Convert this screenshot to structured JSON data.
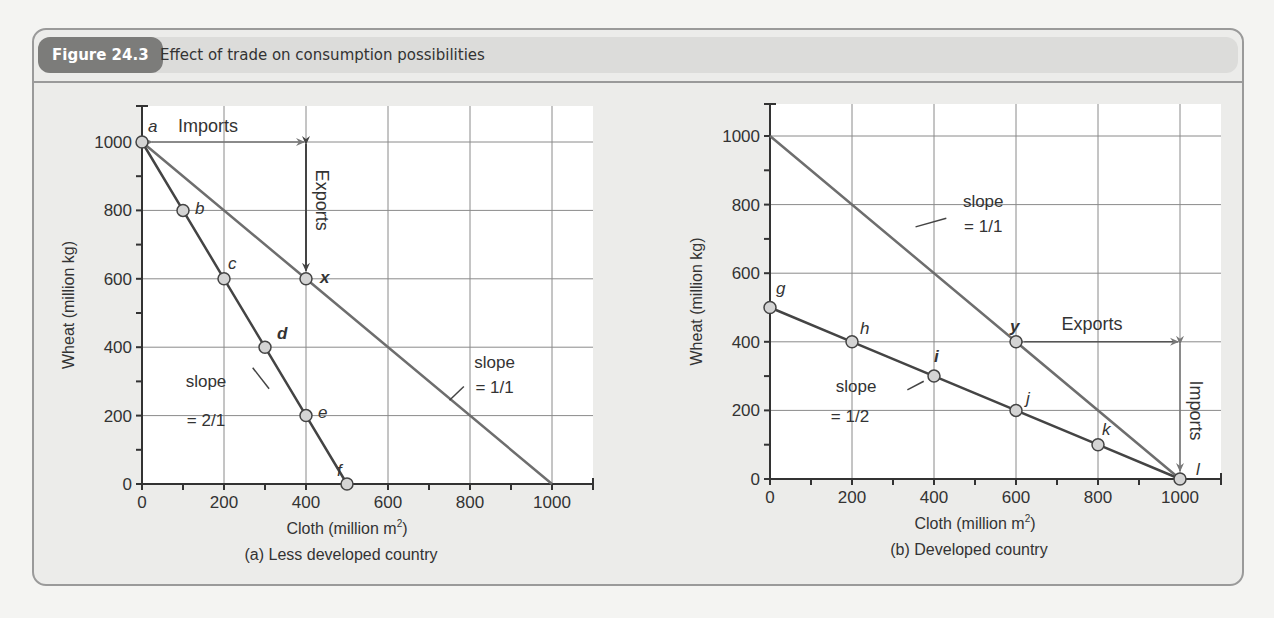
{
  "figure": {
    "number": "Figure 24.3",
    "title": "Effect of trade on consumption possibilities"
  },
  "chart_data": [
    {
      "type": "line",
      "panel": "a",
      "caption": "(a)  Less developed country",
      "xlabel": "Cloth (million m²)",
      "ylabel": "Wheat (million kg)",
      "xlim": [
        0,
        1100
      ],
      "ylim": [
        0,
        1100
      ],
      "xticks": [
        0,
        200,
        400,
        600,
        800,
        1000
      ],
      "yticks": [
        0,
        200,
        400,
        600,
        800,
        1000
      ],
      "grid": true,
      "series": [
        {
          "name": "Production possibility (slope = 2/1)",
          "points": [
            {
              "label": "a",
              "x": 0,
              "y": 1000
            },
            {
              "label": "b",
              "x": 100,
              "y": 800
            },
            {
              "label": "c",
              "x": 200,
              "y": 600
            },
            {
              "label": "d",
              "x": 300,
              "y": 400
            },
            {
              "label": "e",
              "x": 400,
              "y": 200
            },
            {
              "label": "f",
              "x": 500,
              "y": 0
            }
          ]
        },
        {
          "name": "Consumption possibility with trade (slope = 1/1)",
          "points": [
            {
              "x": 0,
              "y": 1000
            },
            {
              "label": "x",
              "x": 400,
              "y": 600
            },
            {
              "x": 1000,
              "y": 0
            }
          ]
        }
      ],
      "annotations": [
        {
          "text": "Imports",
          "type": "horizontal-arrow",
          "from": [
            0,
            1000
          ],
          "to": [
            400,
            1000
          ]
        },
        {
          "text": "Exports",
          "type": "vertical-arrow",
          "from": [
            400,
            1000
          ],
          "to": [
            400,
            600
          ]
        },
        {
          "text": "slope\n= 2/1",
          "target": "production line"
        },
        {
          "text": "slope\n= 1/1",
          "target": "trade line"
        }
      ]
    },
    {
      "type": "line",
      "panel": "b",
      "caption": "(b)  Developed country",
      "xlabel": "Cloth (million m²)",
      "ylabel": "Wheat (million kg)",
      "xlim": [
        0,
        1100
      ],
      "ylim": [
        0,
        1100
      ],
      "xticks": [
        0,
        200,
        400,
        600,
        800,
        1000
      ],
      "yticks": [
        0,
        200,
        400,
        600,
        800,
        1000
      ],
      "grid": true,
      "series": [
        {
          "name": "Production possibility (slope = 1/2)",
          "points": [
            {
              "label": "g",
              "x": 0,
              "y": 500
            },
            {
              "label": "h",
              "x": 200,
              "y": 400
            },
            {
              "label": "i",
              "x": 400,
              "y": 300
            },
            {
              "label": "j",
              "x": 600,
              "y": 200
            },
            {
              "label": "k",
              "x": 800,
              "y": 100
            },
            {
              "label": "l",
              "x": 1000,
              "y": 0
            }
          ]
        },
        {
          "name": "Consumption possibility with trade (slope = 1/1)",
          "points": [
            {
              "x": 0,
              "y": 1000
            },
            {
              "label": "y",
              "x": 600,
              "y": 400
            },
            {
              "x": 1000,
              "y": 0
            }
          ]
        }
      ],
      "annotations": [
        {
          "text": "Exports",
          "type": "horizontal-arrow",
          "from": [
            600,
            400
          ],
          "to": [
            1000,
            400
          ]
        },
        {
          "text": "Imports",
          "type": "vertical-arrow",
          "from": [
            1000,
            400
          ],
          "to": [
            1000,
            0
          ]
        },
        {
          "text": "slope\n= 1/1",
          "target": "trade line"
        },
        {
          "text": "slope\n= 1/2",
          "target": "production line"
        }
      ]
    }
  ],
  "labels": {
    "slope": "slope",
    "a_slope_prod": "= 2/1",
    "a_slope_trade": "= 1/1",
    "b_slope_trade": "= 1/1",
    "b_slope_prod": "= 1/2",
    "imports": "Imports",
    "exports": "Exports"
  }
}
